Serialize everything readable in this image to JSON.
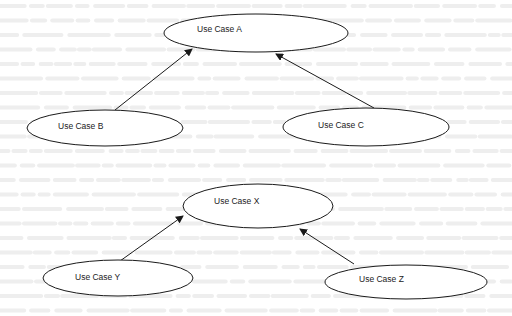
{
  "diagram": {
    "type": "use-case-diagram",
    "use_cases": [
      {
        "id": "A",
        "label": "Use Case A"
      },
      {
        "id": "B",
        "label": "Use Case B"
      },
      {
        "id": "C",
        "label": "Use Case C"
      },
      {
        "id": "X",
        "label": "Use Case X"
      },
      {
        "id": "Y",
        "label": "Use Case Y"
      },
      {
        "id": "Z",
        "label": "Use Case Z"
      }
    ],
    "relationships": [
      {
        "from": "B",
        "to": "A",
        "kind": "directed-arrow"
      },
      {
        "from": "C",
        "to": "A",
        "kind": "directed-arrow"
      },
      {
        "from": "Y",
        "to": "X",
        "kind": "directed-arrow"
      },
      {
        "from": "Z",
        "to": "X",
        "kind": "directed-arrow"
      }
    ],
    "colors": {
      "stroke": "#1a1a1a",
      "background": "#ffffff",
      "bleed_through": "#eeeeee"
    }
  }
}
